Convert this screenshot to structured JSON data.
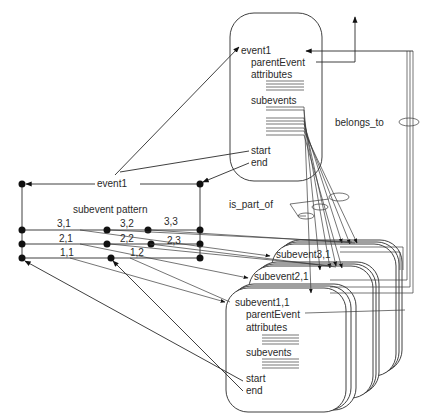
{
  "diagram": {
    "parent_event": {
      "name": "event1",
      "fields": {
        "parent": "parentEvent",
        "attributes": "attributes",
        "subevents": "subevents",
        "start": "start",
        "end": "end"
      }
    },
    "subevent_cards": [
      {
        "name": "subevent3,1"
      },
      {
        "name": "subevent2,1"
      },
      {
        "name": "subevent1,1",
        "fields": {
          "parent": "parentEvent",
          "attributes": "attributes",
          "subevents": "subevents",
          "start": "start",
          "end": "end"
        }
      }
    ],
    "pattern": {
      "event_label": "event1",
      "title": "subevent pattern",
      "cells": [
        {
          "label": "3,1"
        },
        {
          "label": "3,2"
        },
        {
          "label": "3,3"
        },
        {
          "label": "2,1"
        },
        {
          "label": "2,2"
        },
        {
          "label": "2,3"
        },
        {
          "label": "1,1"
        },
        {
          "label": "1,2"
        }
      ]
    },
    "relations": {
      "belongs_to": "belongs_to",
      "is_part_of": "is_part_of"
    }
  }
}
